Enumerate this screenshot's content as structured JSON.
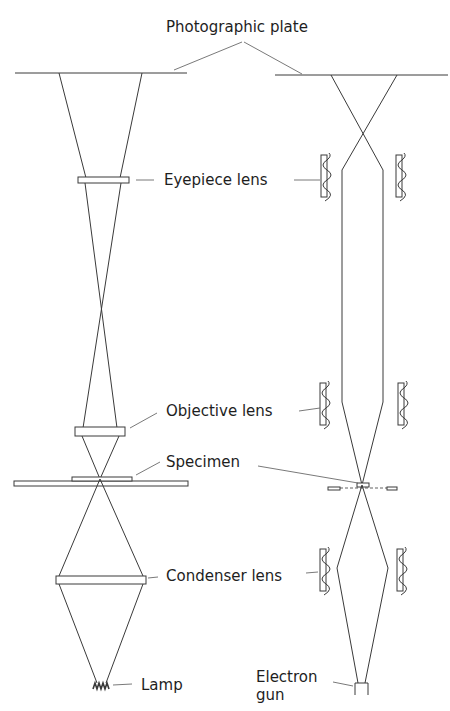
{
  "diagram": {
    "labels": {
      "photographic_plate": "Photographic plate",
      "eyepiece_lens": "Eyepiece lens",
      "objective_lens": "Objective lens",
      "specimen": "Specimen",
      "condenser_lens": "Condenser lens",
      "lamp": "Lamp",
      "electron_gun_line1": "Electron",
      "electron_gun_line2": "gun"
    },
    "columns": [
      {
        "name": "Light microscope",
        "side": "left",
        "components": [
          "Photographic plate",
          "Eyepiece lens",
          "Objective lens",
          "Specimen",
          "Condenser lens",
          "Lamp"
        ]
      },
      {
        "name": "Electron microscope",
        "side": "right",
        "components": [
          "Photographic plate",
          "Eyepiece lens",
          "Objective lens",
          "Specimen",
          "Condenser lens",
          "Electron gun"
        ]
      }
    ],
    "colors": {
      "line": "#3a3a3a",
      "text": "#1e1e1e",
      "background": "#ffffff"
    }
  }
}
